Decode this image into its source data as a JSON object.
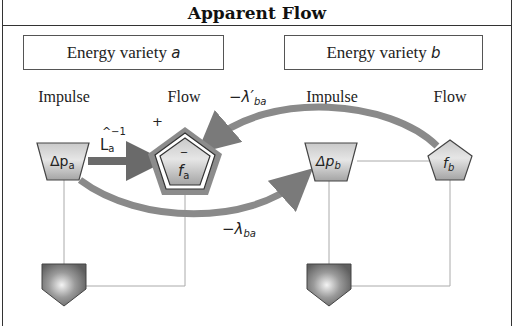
{
  "title": "Apparent Flow",
  "varieties": [
    {
      "label": "Energy variety ",
      "symbol": "a"
    },
    {
      "label": "Energy variety ",
      "symbol": "b"
    }
  ],
  "columns": {
    "a_impulse": "Impulse",
    "a_flow": "Flow",
    "b_impulse": "Impulse",
    "b_flow": "Flow"
  },
  "nodes": {
    "dp_a": {
      "base": "Δp",
      "sub": "a"
    },
    "f_a": {
      "base": "f",
      "sub": "a",
      "bar": "‾",
      "sign": "+"
    },
    "dp_b": {
      "base": "Δp",
      "sub": "b"
    },
    "f_b": {
      "base": "f",
      "sub": "b"
    }
  },
  "edges": {
    "inductance": {
      "base": "L",
      "hat": "^",
      "sub": "a",
      "sup": "−1"
    },
    "lambda_prime": {
      "minus": "−",
      "base": "λ′",
      "sub": "ba"
    },
    "lambda": {
      "minus": "−",
      "base": "λ",
      "sub": "ba"
    }
  },
  "colors": {
    "arrow": "#7a7a7a",
    "node_fill_light": "#e8e8e8",
    "node_fill_dark": "#9a9a9a",
    "ground_fill": "#6f6f6f",
    "line": "#aaaaaa",
    "border": "#333333"
  }
}
